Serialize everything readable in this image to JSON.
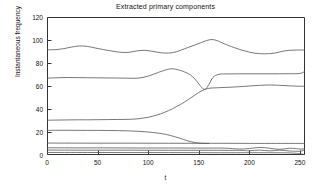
{
  "chart_data": {
    "type": "line",
    "title": "Extracted primary components",
    "xlabel": "t",
    "ylabel": "Instantaneous frequency",
    "xlim": [
      0,
      255
    ],
    "ylim": [
      0,
      120
    ],
    "xticks": [
      0,
      50,
      100,
      150,
      200,
      250
    ],
    "yticks": [
      0,
      20,
      40,
      60,
      80,
      100,
      120
    ],
    "grid": false,
    "legend": "none",
    "line_color": "#555555",
    "axis_color": "#333333",
    "background": "#ffffff",
    "series": [
      {
        "name": "component-1-highest",
        "x": [
          0,
          8,
          16,
          24,
          32,
          40,
          48,
          56,
          64,
          72,
          80,
          88,
          96,
          104,
          112,
          120,
          128,
          136,
          144,
          152,
          158,
          163,
          168,
          175,
          185,
          195,
          205,
          215,
          225,
          235,
          245,
          255
        ],
        "values": [
          91.5,
          91.6,
          92.4,
          93.8,
          94.8,
          94.4,
          93.0,
          91.6,
          90.4,
          89.4,
          89.2,
          90.4,
          91.0,
          90.2,
          89.0,
          88.6,
          89.8,
          92.4,
          95.0,
          97.6,
          99.6,
          100.4,
          99.5,
          96.8,
          93.4,
          90.6,
          88.6,
          88.0,
          88.6,
          90.6,
          91.2,
          91.3
        ]
      },
      {
        "name": "component-2-upper-mid",
        "x": [
          0,
          10,
          20,
          30,
          40,
          50,
          60,
          70,
          80,
          90,
          100,
          110,
          118,
          124,
          130,
          136,
          140,
          144,
          148,
          152,
          156,
          160,
          164,
          170,
          180,
          190,
          200,
          210,
          220,
          230,
          240,
          250,
          255
        ],
        "values": [
          66.8,
          67.2,
          67.4,
          67.3,
          67.2,
          67.1,
          67.0,
          66.9,
          66.8,
          66.8,
          68.6,
          71.8,
          74.2,
          75.0,
          74.0,
          72.2,
          70.6,
          68.0,
          64.2,
          59.6,
          57.0,
          61.2,
          67.4,
          70.2,
          70.5,
          70.6,
          70.6,
          70.6,
          70.6,
          70.6,
          70.7,
          70.9,
          72.8
        ]
      },
      {
        "name": "component-3-rising",
        "x": [
          0,
          10,
          20,
          30,
          40,
          50,
          60,
          70,
          80,
          90,
          100,
          108,
          116,
          124,
          132,
          140,
          146,
          150,
          154,
          158,
          162,
          166,
          172,
          180,
          190,
          200,
          210,
          220,
          230,
          240,
          250,
          255
        ],
        "values": [
          30.2,
          30.4,
          30.5,
          30.6,
          30.6,
          30.7,
          30.8,
          30.9,
          31.0,
          31.5,
          32.8,
          34.6,
          37.0,
          40.2,
          44.0,
          48.4,
          52.0,
          54.4,
          56.2,
          57.6,
          58.2,
          58.4,
          58.6,
          58.9,
          59.4,
          60.0,
          60.6,
          60.9,
          60.6,
          60.1,
          59.8,
          59.8
        ]
      },
      {
        "name": "component-4-descending",
        "x": [
          0,
          10,
          20,
          30,
          40,
          50,
          60,
          70,
          80,
          90,
          100,
          110,
          118,
          126,
          132,
          138,
          143,
          148,
          152,
          156,
          160
        ],
        "values": [
          21.4,
          21.5,
          21.5,
          21.4,
          21.4,
          21.4,
          21.3,
          21.2,
          21.0,
          20.6,
          20.0,
          19.0,
          17.8,
          16.0,
          14.4,
          12.6,
          11.4,
          10.6,
          10.2,
          10.1,
          10.0
        ]
      },
      {
        "name": "component-5-flat-ten",
        "x": [
          0,
          40,
          80,
          120,
          160,
          200,
          240,
          255
        ],
        "values": [
          10.4,
          10.3,
          10.3,
          10.2,
          10.2,
          10.1,
          10.1,
          10.1
        ]
      },
      {
        "name": "component-6-flat-six",
        "x": [
          0,
          30,
          60,
          90,
          120,
          150,
          175,
          190,
          200,
          210,
          220,
          230,
          240,
          250,
          255
        ],
        "values": [
          6.3,
          6.2,
          6.2,
          6.1,
          6.1,
          6.0,
          6.0,
          5.2,
          5.6,
          6.6,
          5.9,
          4.9,
          5.9,
          5.2,
          5.4
        ]
      },
      {
        "name": "component-7-flat-four",
        "x": [
          0,
          40,
          80,
          120,
          160,
          190,
          200,
          210,
          220,
          230,
          240,
          250,
          255
        ],
        "values": [
          4.3,
          4.2,
          4.2,
          4.1,
          4.1,
          4.0,
          3.7,
          4.3,
          3.6,
          4.2,
          3.5,
          3.3,
          4.6
        ]
      },
      {
        "name": "component-8-lowest",
        "x": [
          0,
          40,
          80,
          120,
          160,
          200,
          220,
          235,
          245,
          250,
          255
        ],
        "values": [
          2.2,
          2.2,
          2.1,
          2.1,
          2.0,
          2.0,
          2.0,
          1.9,
          1.6,
          1.0,
          0.4
        ]
      }
    ]
  }
}
